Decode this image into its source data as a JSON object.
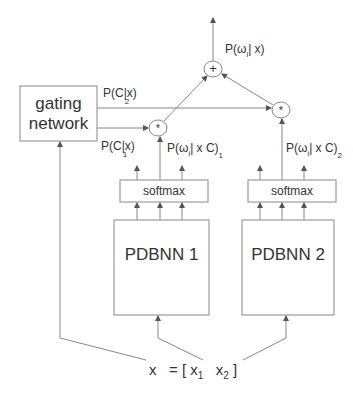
{
  "diagram": {
    "nodes": {
      "gating": {
        "label_line1": "gating",
        "label_line2": "network"
      },
      "softmax1": {
        "label": "softmax"
      },
      "softmax2": {
        "label": "softmax"
      },
      "pdbnn1": {
        "label": "PDBNN 1"
      },
      "pdbnn2": {
        "label": "PDBNN 2"
      },
      "mult1": {
        "symbol": "*"
      },
      "mult2": {
        "symbol": "*"
      },
      "sum": {
        "symbol": "+"
      }
    },
    "labels": {
      "output": {
        "main": "P(ω",
        "sub": "i",
        "rest": "| x)"
      },
      "pc2": {
        "main": "P(C|x)",
        "sub": "2"
      },
      "pc1": {
        "main": "P(C|x)",
        "sub": "1"
      },
      "pw1": {
        "main": "P(ω",
        "sub": "i",
        "mid": "| x  C)",
        "sub2": "1"
      },
      "pw2": {
        "main": "P(ω",
        "sub": "i",
        "mid": "| x  C)",
        "sub2": "2"
      },
      "input": {
        "x": "x",
        "eq": "= [ x",
        "sub1": "1",
        "x2": "x",
        "sub2": "2",
        "close": "]"
      }
    },
    "colors": {
      "line": "#777777",
      "text": "#333333",
      "background": "#ffffff"
    }
  }
}
